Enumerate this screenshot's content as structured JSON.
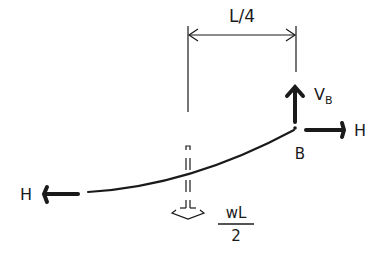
{
  "diagram": {
    "type": "free-body sketch of cable segment",
    "dimension": {
      "label": "L/4"
    },
    "point": {
      "label": "B"
    },
    "forces": {
      "vertical_reaction": {
        "label": "V",
        "subscript": "B",
        "direction": "up"
      },
      "horizontal_right": {
        "label": "H",
        "direction": "right"
      },
      "horizontal_left": {
        "label": "H",
        "direction": "left"
      },
      "distributed_resultant": {
        "numerator": "wL",
        "denominator": "2",
        "direction": "down",
        "style": "dashed"
      }
    },
    "colors": {
      "ink": "#1a1a1a",
      "background": "#ffffff"
    }
  }
}
